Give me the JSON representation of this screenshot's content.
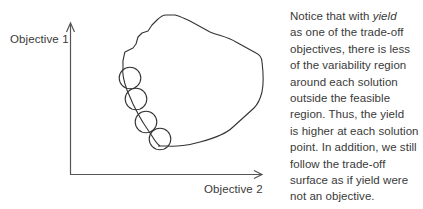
{
  "diagram": {
    "y_axis_label": "Objective 1",
    "x_axis_label": "Objective 2",
    "elements": {
      "feasible_region": "irregular closed region (feasible region)",
      "variability_circles": 4,
      "tradeoff_surface": "lower-left boundary of the feasible region"
    },
    "colors": {
      "stroke": "#333333",
      "axis": "#555555",
      "text": "#3a3a3a"
    }
  },
  "caption": {
    "lines": [
      {
        "pre": "Notice that with ",
        "em": "yield",
        "post": ""
      },
      {
        "pre": "as one of the trade-off",
        "em": "",
        "post": ""
      },
      {
        "pre": "objectives, there is less",
        "em": "",
        "post": ""
      },
      {
        "pre": "of the variability region",
        "em": "",
        "post": ""
      },
      {
        "pre": "around each solution",
        "em": "",
        "post": ""
      },
      {
        "pre": "outside the feasible",
        "em": "",
        "post": ""
      },
      {
        "pre": "region. Thus, the yield",
        "em": "",
        "post": ""
      },
      {
        "pre": "is higher at each solution",
        "em": "",
        "post": ""
      },
      {
        "pre": "point. In addition, we still",
        "em": "",
        "post": ""
      },
      {
        "pre": "follow the trade-off",
        "em": "",
        "post": ""
      },
      {
        "pre": "surface as if yield were",
        "em": "",
        "post": ""
      },
      {
        "pre": "not an objective.",
        "em": "",
        "post": ""
      }
    ]
  }
}
